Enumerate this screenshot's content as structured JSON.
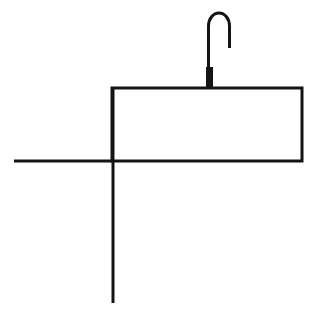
{
  "document": {
    "title": "Line Drawing",
    "type": "monochrome-line-drawing",
    "description": "Simple black line drawing on white background: a hook or handle shape above a horizontal rectangle, crossed by a long vertical line and a horizontal line forming a cross at the lower-left of the rectangle.",
    "canvas": {
      "width": 313,
      "height": 313,
      "background_color": "#ffffff"
    },
    "ink_color": "#141414",
    "default_stroke_width": 3
  },
  "drawing": {
    "shapes": [
      {
        "id": "hook",
        "name": "hook-shape",
        "label": "Hook",
        "stroke_width": 3,
        "path": "M 208.5 88 L 208.5 26 A 10.5 13 0 0 1 229.5 26 L 229.5 48"
      },
      {
        "id": "hook-stem-thick",
        "name": "hook-stem-thick",
        "label": "Hook thick stem",
        "fill_color": "#141414",
        "x": 206,
        "y": 67,
        "width": 7,
        "height": 22
      },
      {
        "id": "rectangle",
        "name": "rectangle-shape",
        "label": "Rectangle",
        "stroke_width": 3,
        "x": 112,
        "y": 88,
        "width": 190,
        "height": 73
      },
      {
        "id": "horizontal-line",
        "name": "horizontal-line",
        "label": "Horizontal line",
        "stroke_width": 3,
        "x1": 14,
        "y1": 161,
        "x2": 114,
        "y2": 161
      },
      {
        "id": "vertical-line",
        "name": "vertical-line",
        "label": "Vertical line",
        "stroke_width": 3,
        "x1": 113,
        "y1": 89,
        "x2": 113,
        "y2": 303
      }
    ]
  }
}
